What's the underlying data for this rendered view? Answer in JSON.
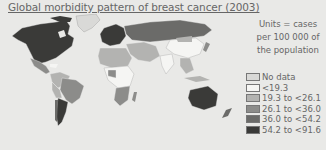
{
  "title": "Global morbidity pattern of breast cancer (2003)",
  "units_note": [
    "Units = cases",
    "per 100 000 of",
    "the population"
  ],
  "legend": [
    {
      "label": "No data",
      "color": "#d9d9d7"
    },
    {
      "label": "<19.3",
      "color": "#f5f5f3"
    },
    {
      "label": "19.3 to <26.1",
      "color": "#b3b3b1"
    },
    {
      "label": "26.1 to <36.0",
      "color": "#8c8c8a"
    },
    {
      "label": "36.0 to <54.2",
      "color": "#6b6b69"
    },
    {
      "label": "54.2 to <91.6",
      "color": "#3a3a38"
    }
  ],
  "regions": {
    "north_america": "54.2 to <91.6",
    "greenland": "No data",
    "central_america": "26.1 to <36.0",
    "south_america_north": "19.3 to <26.1",
    "brazil": "26.1 to <36.0",
    "argentina": "54.2 to <91.6",
    "western_europe": "54.2 to <91.6",
    "russia": "36.0 to <54.2",
    "north_africa": "19.3 to <26.1",
    "central_africa": "<19.3",
    "southern_africa": "26.1 to <36.0",
    "middle_east": "19.3 to <26.1",
    "india": "<19.3",
    "china": "<19.3",
    "southeast_asia": "19.3 to <26.1",
    "australia": "54.2 to <91.6",
    "new_zealand": "36.0 to <54.2"
  }
}
